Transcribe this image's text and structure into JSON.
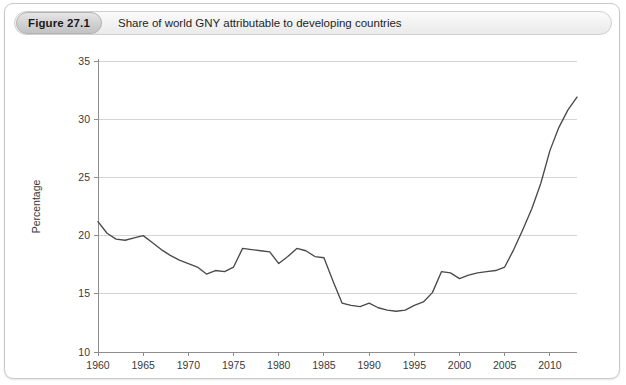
{
  "figure": {
    "badge_label": "Figure 27.1",
    "caption": "Share of world GNY attributable to developing countries"
  },
  "chart_data": {
    "type": "line",
    "title": "Share of world GNY attributable to developing countries",
    "xlabel": "",
    "ylabel": "Percentage",
    "xlim": [
      1960,
      2013
    ],
    "ylim": [
      10,
      35
    ],
    "ytick_labels": [
      "10",
      "15",
      "20",
      "25",
      "30",
      "35"
    ],
    "yticks": [
      10,
      15,
      20,
      25,
      30,
      35
    ],
    "xtick_labels": [
      "1960",
      "1965",
      "1970",
      "1975",
      "1980",
      "1985",
      "1990",
      "1995",
      "2000",
      "2005",
      "2010"
    ],
    "xticks": [
      1960,
      1965,
      1970,
      1975,
      1980,
      1985,
      1990,
      1995,
      2000,
      2005,
      2010
    ],
    "grid": "horizontal",
    "legend": null,
    "line_color": "#4a4a4a",
    "series": [
      {
        "name": "Share of world GNY attributable to developing countries",
        "x": [
          1960,
          1961,
          1962,
          1963,
          1964,
          1965,
          1966,
          1967,
          1968,
          1969,
          1970,
          1971,
          1972,
          1973,
          1974,
          1975,
          1976,
          1977,
          1978,
          1979,
          1980,
          1981,
          1982,
          1983,
          1984,
          1985,
          1986,
          1987,
          1988,
          1989,
          1990,
          1991,
          1992,
          1993,
          1994,
          1995,
          1996,
          1997,
          1998,
          1999,
          2000,
          2001,
          2002,
          2003,
          2004,
          2005,
          2006,
          2007,
          2008,
          2009,
          2010,
          2011,
          2012,
          2013
        ],
        "values": [
          21.2,
          20.2,
          19.7,
          19.6,
          19.8,
          20.0,
          19.4,
          18.8,
          18.3,
          17.9,
          17.6,
          17.3,
          16.7,
          17.0,
          16.9,
          17.3,
          18.9,
          18.8,
          18.7,
          18.6,
          17.6,
          18.2,
          18.9,
          18.7,
          18.2,
          18.1,
          16.1,
          14.2,
          14.0,
          13.9,
          14.2,
          13.8,
          13.6,
          13.5,
          13.6,
          14.0,
          14.3,
          15.1,
          16.9,
          16.8,
          16.3,
          16.6,
          16.8,
          16.9,
          17.0,
          17.3,
          18.8,
          20.5,
          22.3,
          24.5,
          27.3,
          29.3,
          30.8,
          31.9
        ]
      }
    ]
  }
}
